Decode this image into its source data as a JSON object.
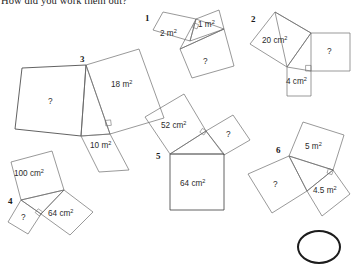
{
  "page": {
    "title": "How did you work them out?",
    "background_color": "#ffffff",
    "ink_color": "#6d6d6d",
    "text_color": "#2b2b2b"
  },
  "figures": [
    {
      "number": "1",
      "unit": "m",
      "squares": [
        {
          "name": "square-a",
          "label": "2 m",
          "sup": "2"
        },
        {
          "name": "square-b",
          "label": "1 m",
          "sup": "2"
        },
        {
          "name": "square-c",
          "label": "?",
          "sup": ""
        }
      ]
    },
    {
      "number": "2",
      "unit": "cm",
      "squares": [
        {
          "name": "square-a",
          "label": "20 cm",
          "sup": "2"
        },
        {
          "name": "square-b",
          "label": "?",
          "sup": ""
        },
        {
          "name": "square-c",
          "label": "4 cm",
          "sup": "2"
        }
      ]
    },
    {
      "number": "3",
      "unit": "m",
      "squares": [
        {
          "name": "square-a",
          "label": "?",
          "sup": ""
        },
        {
          "name": "square-b",
          "label": "18 m",
          "sup": "2"
        },
        {
          "name": "square-c",
          "label": "10 m",
          "sup": "2"
        }
      ]
    },
    {
      "number": "4",
      "unit": "cm",
      "squares": [
        {
          "name": "square-a",
          "label": "100 cm",
          "sup": "2"
        },
        {
          "name": "square-b",
          "label": "64 cm",
          "sup": "2"
        },
        {
          "name": "square-c",
          "label": "?",
          "sup": ""
        }
      ]
    },
    {
      "number": "5",
      "unit": "cm",
      "squares": [
        {
          "name": "square-a",
          "label": "52 cm",
          "sup": "2"
        },
        {
          "name": "square-b",
          "label": "?",
          "sup": ""
        },
        {
          "name": "square-c",
          "label": "64 cm",
          "sup": "2"
        }
      ]
    },
    {
      "number": "6",
      "unit": "m",
      "squares": [
        {
          "name": "square-a",
          "label": "5 m",
          "sup": "2"
        },
        {
          "name": "square-b",
          "label": "4.5 m",
          "sup": "2"
        },
        {
          "name": "square-c",
          "label": "?",
          "sup": ""
        }
      ]
    }
  ]
}
